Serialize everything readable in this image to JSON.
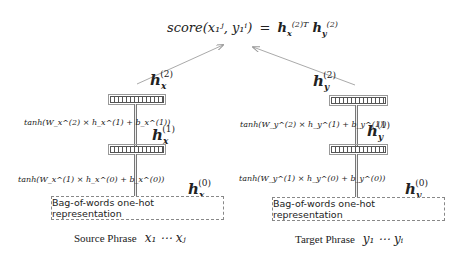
{
  "title_formula": {
    "lhs": "score(x₁ʲ, y₁ⁱ)",
    "equals": "=",
    "rhs_hx": "h",
    "rhs_hx_sub": "x",
    "rhs_hx_sup": "(2)T",
    "rhs_hy": "h",
    "rhs_hy_sub": "y",
    "rhs_hy_sup": "(2)"
  },
  "source": {
    "h2": {
      "base": "h",
      "sub": "x",
      "sup": "(2)"
    },
    "h1": {
      "base": "h",
      "sub": "x",
      "sup": "(1)"
    },
    "h0": {
      "base": "h",
      "sub": "x",
      "sup": "(0)"
    },
    "formula_layer2": "tanh(W_x^(2) × h_x^(1) + b_x^(1))",
    "formula_layer1": "tanh(W_x^(1) × h_x^(0) + b_x^(0))",
    "input_box": "Bag-of-words one-hot representation",
    "phrase_label": "Source Phrase",
    "phrase_vars": "x₁ ⋯ xⱼ"
  },
  "target": {
    "h2": {
      "base": "h",
      "sub": "y",
      "sup": "(2)"
    },
    "h1": {
      "base": "h",
      "sub": "y",
      "sup": "(1)"
    },
    "h0": {
      "base": "h",
      "sub": "y",
      "sup": "(0)"
    },
    "formula_layer2": "tanh(W_y^(2) × h_y^(1) + b_y^(1))",
    "formula_layer1": "tanh(W_y^(1) × h_y^(0) + b_y^(0))",
    "input_box": "Bag-of-words one-hot representation",
    "phrase_label": "Target Phrase",
    "phrase_vars": "y₁ ⋯ yᵢ"
  },
  "colors": {
    "arrow": "#999999",
    "layer_border": "#555555",
    "box_border": "#888888"
  }
}
